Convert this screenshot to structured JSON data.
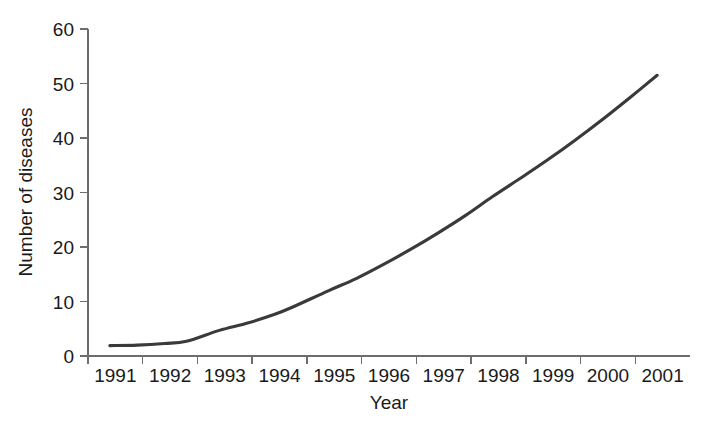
{
  "chart_data": {
    "type": "line",
    "title": "",
    "subtitle": "",
    "xlabel": "Year",
    "ylabel": "Number of diseases",
    "grid": false,
    "legend": null,
    "legend_position": "none",
    "xlim": [
      1990.6,
      2001.6
    ],
    "ylim": [
      0,
      60
    ],
    "x_tick_labels": [
      "1991",
      "1992",
      "1993",
      "1994",
      "1995",
      "1996",
      "1997",
      "1998",
      "1999",
      "2000",
      "2001"
    ],
    "y_tick_labels": [
      "0",
      "10",
      "20",
      "30",
      "40",
      "50",
      "60"
    ],
    "y_ticks": [
      0,
      10,
      20,
      30,
      40,
      50,
      60
    ],
    "line_color": "#3a3a3a",
    "axis_color": "#6d6d6d",
    "x": [
      1991.0,
      1991.5,
      1992.0,
      1992.4,
      1993.0,
      1993.5,
      1994.0,
      1994.3,
      1995.0,
      1995.5,
      1996.0,
      1996.5,
      1997.0,
      1997.5,
      1998.0,
      1998.5,
      1999.0,
      1999.5,
      2000.0,
      2000.5,
      2001.0
    ],
    "series": [
      {
        "name": "Number of diseases",
        "values": [
          1.9,
          2.0,
          2.3,
          2.7,
          4.7,
          6.0,
          7.6,
          8.8,
          12.0,
          14.2,
          16.8,
          19.6,
          22.6,
          25.8,
          29.3,
          32.6,
          36.0,
          39.6,
          43.4,
          47.4,
          51.5
        ]
      }
    ],
    "annotations": []
  },
  "figure": {
    "background_color": "#ffffff"
  }
}
